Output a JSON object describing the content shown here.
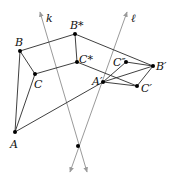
{
  "figure": {
    "colors": {
      "edge": "#2a2a2a",
      "axis": "#9a9a9a",
      "point": "#000000"
    }
  },
  "points": [
    {
      "id": "A",
      "label": "A",
      "x": 15,
      "y": 132,
      "lx": 10,
      "ly": 148
    },
    {
      "id": "B",
      "label": "B",
      "x": 20,
      "y": 51,
      "lx": 15,
      "ly": 46
    },
    {
      "id": "C",
      "label": "C",
      "x": 35,
      "y": 74,
      "lx": 34,
      "ly": 88
    },
    {
      "id": "Bstar",
      "label": "B*",
      "x": 75,
      "y": 34,
      "lx": 70,
      "ly": 29
    },
    {
      "id": "Cstar",
      "label": "C*",
      "x": 77,
      "y": 62,
      "lx": 79,
      "ly": 63
    },
    {
      "id": "Ap",
      "label": "A′",
      "x": 103,
      "y": 82,
      "lx": 92,
      "ly": 85
    },
    {
      "id": "Cpp",
      "label": "C″",
      "x": 126,
      "y": 62,
      "lx": 113,
      "ly": 66
    },
    {
      "id": "Bp",
      "label": "B′",
      "x": 153,
      "y": 66,
      "lx": 156,
      "ly": 70
    },
    {
      "id": "Cp",
      "label": "C′",
      "x": 137,
      "y": 86,
      "lx": 141,
      "ly": 92
    },
    {
      "id": "O",
      "label": "",
      "x": 78,
      "y": 146,
      "lx": 0,
      "ly": 0
    }
  ],
  "lines": [
    {
      "id": "k",
      "label": "k",
      "x1": 40,
      "y1": 12,
      "x2": 87,
      "y2": 172,
      "arrow_top": true,
      "arrow_bottom": true,
      "lx": 46,
      "ly": 22
    },
    {
      "id": "l",
      "label": "ℓ",
      "x1": 127,
      "y1": 12,
      "x2": 70,
      "y2": 172,
      "arrow_top": true,
      "arrow_bottom": true,
      "lx": 131,
      "ly": 22
    }
  ],
  "edges": [
    [
      "A",
      "B"
    ],
    [
      "A",
      "C"
    ],
    [
      "B",
      "C"
    ],
    [
      "B",
      "Bstar"
    ],
    [
      "C",
      "Cstar"
    ],
    [
      "Bstar",
      "Cstar"
    ],
    [
      "A",
      "Ap"
    ],
    [
      "Bstar",
      "Bp"
    ],
    [
      "Cstar",
      "Cp"
    ],
    [
      "Ap",
      "Cpp"
    ],
    [
      "Cpp",
      "Bp"
    ],
    [
      "Ap",
      "Bp"
    ],
    [
      "Ap",
      "Cp"
    ],
    [
      "Cp",
      "Bp"
    ]
  ]
}
